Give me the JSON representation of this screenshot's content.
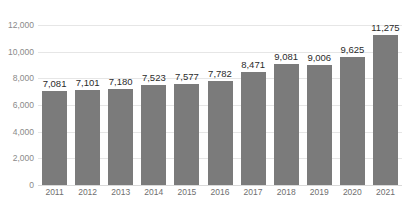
{
  "chart_data": {
    "type": "bar",
    "title": "",
    "subtitle": "",
    "xlabel": "",
    "ylabel": "",
    "categories": [
      "2011",
      "2012",
      "2013",
      "2014",
      "2015",
      "2016",
      "2017",
      "2018",
      "2019",
      "2020",
      "2021"
    ],
    "values": [
      7081,
      7101,
      7180,
      7523,
      7577,
      7782,
      8471,
      9081,
      9006,
      9625,
      11275
    ],
    "data_labels": [
      "7,081",
      "7,101",
      "7,180",
      "7,523",
      "7,577",
      "7,782",
      "8,471",
      "9,081",
      "9,006",
      "9,625",
      "11,275"
    ],
    "ylim": [
      0,
      12000
    ],
    "ytick_values": [
      0,
      2000,
      4000,
      6000,
      8000,
      10000,
      12000
    ],
    "ytick_labels": [
      "0",
      "2,000",
      "4,000",
      "6,000",
      "8,000",
      "10,000",
      "12,000"
    ],
    "grid": true,
    "legend": false,
    "legend_position": "none",
    "series_count": 1,
    "colors": {
      "bar": "#7b7b7b",
      "gridline": "#e6e6e6",
      "baseline": "#d9d9d9",
      "axis_label": "#8a8a8a",
      "data_label": "#2b2b2b",
      "background": "#ffffff"
    }
  }
}
